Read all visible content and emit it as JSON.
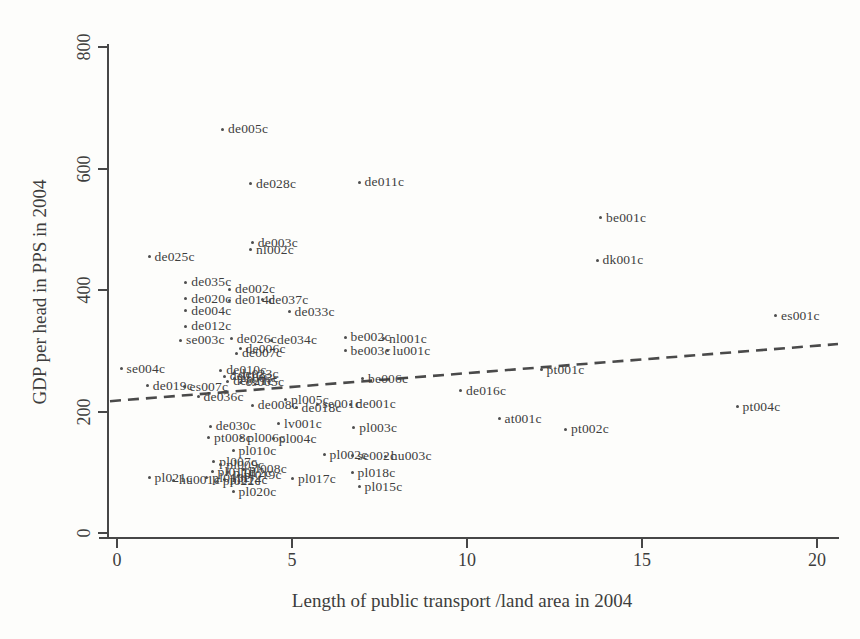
{
  "chart_data": {
    "type": "scatter",
    "title": "",
    "xlabel": "Length of public transport /land area in 2004",
    "ylabel": "GDP per head in PPS in 2004",
    "xlim": [
      0,
      20
    ],
    "ylim": [
      0,
      800
    ],
    "xticks": [
      0,
      5,
      10,
      15,
      20
    ],
    "yticks": [
      0,
      200,
      400,
      600,
      800
    ],
    "grid": false,
    "legend": false,
    "marker_color": "#4e4e4e",
    "text_color": "#3d3d3d",
    "trendline": {
      "x1": -0.2,
      "y1": 217,
      "x2": 20.6,
      "y2": 311,
      "style": "dashed",
      "color": "#4a4a4a"
    },
    "points": [
      {
        "label": "de005c",
        "x": 3.0,
        "y": 665
      },
      {
        "label": "de028c",
        "x": 3.8,
        "y": 575
      },
      {
        "label": "de011c",
        "x": 6.9,
        "y": 577
      },
      {
        "label": "be001c",
        "x": 13.8,
        "y": 519
      },
      {
        "label": "dk001c",
        "x": 13.7,
        "y": 449
      },
      {
        "label": "es001c",
        "x": 18.8,
        "y": 358
      },
      {
        "label": "de025c",
        "x": 0.9,
        "y": 455
      },
      {
        "label": "de003c",
        "x": 3.85,
        "y": 478
      },
      {
        "label": "nl002c",
        "x": 3.8,
        "y": 466
      },
      {
        "label": "de035c",
        "x": 1.95,
        "y": 413
      },
      {
        "label": "de002c",
        "x": 3.2,
        "y": 401
      },
      {
        "label": "de020c",
        "x": 1.95,
        "y": 386
      },
      {
        "label": "de014c",
        "x": 3.2,
        "y": 383
      },
      {
        "label": "de037c",
        "x": 4.15,
        "y": 384
      },
      {
        "label": "de004c",
        "x": 1.95,
        "y": 366
      },
      {
        "label": "de033c",
        "x": 4.9,
        "y": 364
      },
      {
        "label": "de012c",
        "x": 1.95,
        "y": 340
      },
      {
        "label": "se003c",
        "x": 1.8,
        "y": 317
      },
      {
        "label": "de026c",
        "x": 3.25,
        "y": 320
      },
      {
        "label": "de034c",
        "x": 4.4,
        "y": 317
      },
      {
        "label": "de006c",
        "x": 3.5,
        "y": 303
      },
      {
        "label": "be002c",
        "x": 6.5,
        "y": 322
      },
      {
        "label": "nl001c",
        "x": 7.6,
        "y": 320
      },
      {
        "label": "be003c",
        "x": 6.5,
        "y": 300
      },
      {
        "label": "lu001c",
        "x": 7.7,
        "y": 300
      },
      {
        "label": "se004c",
        "x": 0.1,
        "y": 270
      },
      {
        "label": "be006c",
        "x": 7.0,
        "y": 254
      },
      {
        "label": "pt001c",
        "x": 12.1,
        "y": 269
      },
      {
        "label": "de016c",
        "x": 9.8,
        "y": 234
      },
      {
        "label": "at001c",
        "x": 10.9,
        "y": 188
      },
      {
        "label": "pt002c",
        "x": 12.8,
        "y": 171
      },
      {
        "label": "pt004c",
        "x": 17.7,
        "y": 208
      },
      {
        "label": "de007c",
        "x": 3.4,
        "y": 296
      },
      {
        "label": "de010c",
        "x": 2.95,
        "y": 268
      },
      {
        "label": "de013c",
        "x": 3.05,
        "y": 258
      },
      {
        "label": "de021c",
        "x": 3.15,
        "y": 250
      },
      {
        "label": "de023c",
        "x": 3.3,
        "y": 262
      },
      {
        "label": "es003c",
        "x": 3.35,
        "y": 255
      },
      {
        "label": "es005c",
        "x": 3.5,
        "y": 248
      },
      {
        "label": "de019c",
        "x": 0.85,
        "y": 242
      },
      {
        "label": "es007c",
        "x": 1.9,
        "y": 241
      },
      {
        "label": "de036c",
        "x": 2.3,
        "y": 224
      },
      {
        "label": "pl005c",
        "x": 4.8,
        "y": 219
      },
      {
        "label": "de008c",
        "x": 3.85,
        "y": 210
      },
      {
        "label": "de018c",
        "x": 5.1,
        "y": 206
      },
      {
        "label": "se001c",
        "x": 5.7,
        "y": 212
      },
      {
        "label": "de001c",
        "x": 6.65,
        "y": 212
      },
      {
        "label": "de030c",
        "x": 2.65,
        "y": 176
      },
      {
        "label": "lv001c",
        "x": 4.6,
        "y": 180
      },
      {
        "label": "pl003c",
        "x": 6.75,
        "y": 173
      },
      {
        "label": "pt008c",
        "x": 2.6,
        "y": 157
      },
      {
        "label": "pl006c",
        "x": 3.55,
        "y": 157
      },
      {
        "label": "pl004c",
        "x": 4.45,
        "y": 155
      },
      {
        "label": "pl010c",
        "x": 3.3,
        "y": 135
      },
      {
        "label": "pl002c",
        "x": 5.9,
        "y": 129
      },
      {
        "label": "se002c",
        "x": 6.7,
        "y": 127
      },
      {
        "label": "hu003c",
        "x": 7.65,
        "y": 126
      },
      {
        "label": "pl007c",
        "x": 2.75,
        "y": 117
      },
      {
        "label": "pl009c",
        "x": 2.95,
        "y": 112
      },
      {
        "label": "pl008c",
        "x": 3.6,
        "y": 105
      },
      {
        "label": "pl011c",
        "x": 2.7,
        "y": 101
      },
      {
        "label": "pl012c",
        "x": 3.15,
        "y": 99
      },
      {
        "label": "pl019c",
        "x": 3.45,
        "y": 95
      },
      {
        "label": "pl013c",
        "x": 2.55,
        "y": 91
      },
      {
        "label": "pl014c",
        "x": 3.05,
        "y": 88
      },
      {
        "label": "pl022c",
        "x": 2.85,
        "y": 85
      },
      {
        "label": "pl021c",
        "x": 0.9,
        "y": 91
      },
      {
        "label": "hu001c",
        "x": 1.6,
        "y": 87
      },
      {
        "label": "pl017c",
        "x": 5.0,
        "y": 89
      },
      {
        "label": "pl018c",
        "x": 6.7,
        "y": 99
      },
      {
        "label": "pl015c",
        "x": 6.9,
        "y": 76
      },
      {
        "label": "pl020c",
        "x": 3.3,
        "y": 68
      }
    ]
  }
}
